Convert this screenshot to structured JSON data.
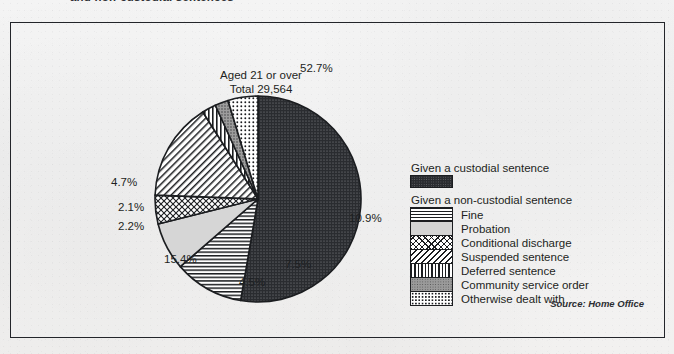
{
  "page": {
    "top_heading": "and non-custodial sentences",
    "source_note": "Source: Home Office",
    "paper_color": "#f1f0ef",
    "ink_color": "#1d1f22"
  },
  "chart_data": {
    "type": "pie",
    "title": "Aged 21 or over",
    "subtitle": "Total 29,564",
    "total": 29564,
    "unit": "%",
    "legend_position": "right",
    "grid": false,
    "categories": [
      "Given a custodial sentence",
      "Fine",
      "Probation",
      "Conditional discharge",
      "Suspended sentence",
      "Deferred sentence",
      "Community service order",
      "Otherwise dealt with"
    ],
    "values": [
      52.7,
      10.9,
      7.5,
      4.5,
      15.4,
      2.2,
      2.1,
      4.7
    ],
    "slices": [
      {
        "label": "Given a custodial sentence",
        "value": 52.7,
        "display": "52.7%",
        "pattern": "custodial",
        "label_x": 299,
        "label_y": 68
      },
      {
        "label": "Fine",
        "value": 10.9,
        "display": "10.9%",
        "pattern": "fine",
        "label_x": 348,
        "label_y": 218
      },
      {
        "label": "Probation",
        "value": 7.5,
        "display": "7.5%",
        "pattern": "probation",
        "label_x": 284,
        "label_y": 264
      },
      {
        "label": "Conditional discharge",
        "value": 4.5,
        "display": "4.5%",
        "pattern": "conditional",
        "label_x": 238,
        "label_y": 282
      },
      {
        "label": "Suspended sentence",
        "value": 15.4,
        "display": "15.4%",
        "pattern": "suspended",
        "label_x": 163,
        "label_y": 259
      },
      {
        "label": "Deferred sentence",
        "value": 2.2,
        "display": "2.2%",
        "pattern": "deferred",
        "label_x": 117,
        "label_y": 226
      },
      {
        "label": "Community service order",
        "value": 2.1,
        "display": "2.1%",
        "pattern": "community",
        "label_x": 117,
        "label_y": 207
      },
      {
        "label": "Otherwise dealt with",
        "value": 4.7,
        "display": "4.7%",
        "pattern": "otherwise",
        "label_x": 110,
        "label_y": 182
      }
    ]
  },
  "legend": {
    "custodial_header": "Given a custodial sentence",
    "noncustodial_header": "Given a non-custodial sentence",
    "noncustodial_items": [
      {
        "label": "Fine",
        "pattern": "fine"
      },
      {
        "label": "Probation",
        "pattern": "probation"
      },
      {
        "label": "Conditional discharge",
        "pattern": "conditional"
      },
      {
        "label": "Suspended sentence",
        "pattern": "suspended"
      },
      {
        "label": "Deferred sentence",
        "pattern": "deferred"
      },
      {
        "label": "Community service order",
        "pattern": "community"
      },
      {
        "label": "Otherwise dealt with",
        "pattern": "otherwise"
      }
    ]
  }
}
